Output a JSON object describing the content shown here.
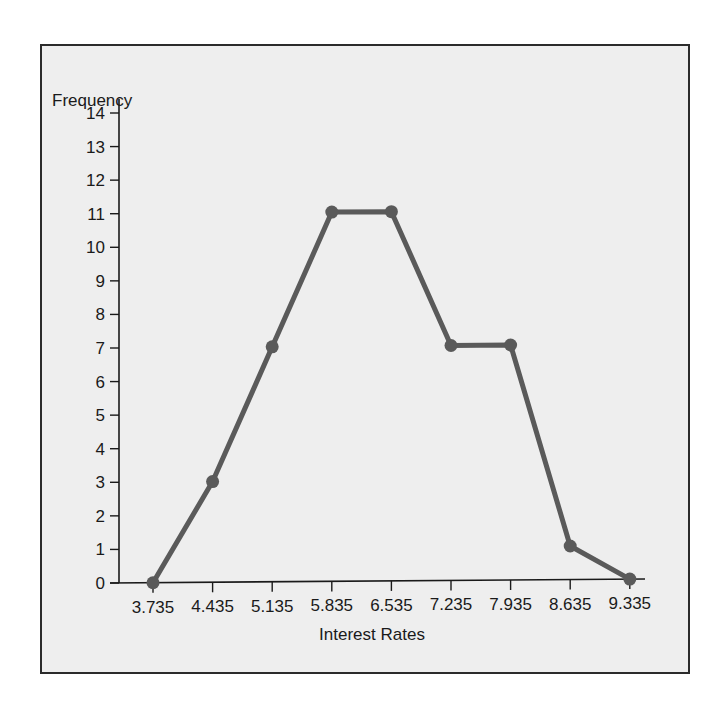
{
  "chart_data": {
    "type": "line",
    "title": "",
    "xlabel": "Interest Rates",
    "ylabel": "Frequency",
    "categories": [
      "3.735",
      "4.435",
      "5.135",
      "5.835",
      "6.535",
      "7.235",
      "7.935",
      "8.635",
      "9.335"
    ],
    "x": [
      3.735,
      4.435,
      5.135,
      5.835,
      6.535,
      7.235,
      7.935,
      8.635,
      9.335
    ],
    "values": [
      0,
      3,
      7,
      11,
      11,
      7,
      7,
      1,
      0
    ],
    "series": [
      {
        "name": "Frequency",
        "values": [
          0,
          3,
          7,
          11,
          11,
          7,
          7,
          1,
          0
        ],
        "color": "#5a5a5a",
        "markers": true
      }
    ],
    "yticks": [
      "0",
      "1",
      "2",
      "3",
      "4",
      "5",
      "6",
      "7",
      "8",
      "9",
      "10",
      "11",
      "12",
      "13",
      "14"
    ],
    "ylim": [
      0,
      14
    ],
    "grid": false,
    "legend": null
  },
  "colors": {
    "line": "#5a5a5a",
    "marker": "#5a5a5a",
    "axis": "#1a1a1a",
    "panel_background": "#eeeeee",
    "frame_border": "#2b2b2b"
  }
}
